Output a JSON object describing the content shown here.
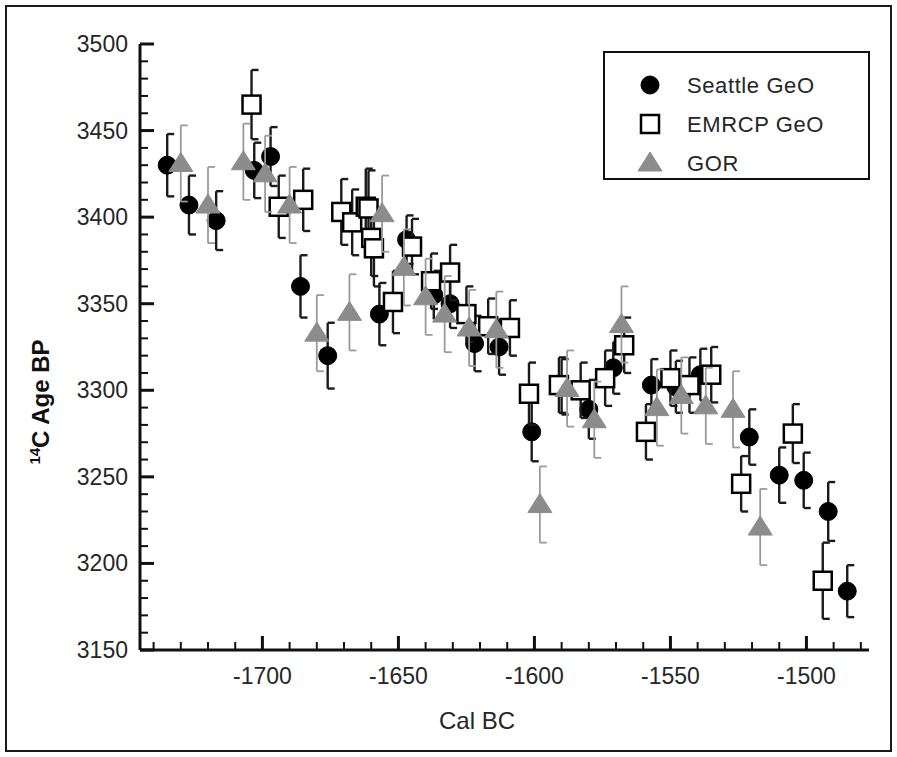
{
  "figure": {
    "xlabel": "Cal BC",
    "ylabel_sup": "14",
    "ylabel_main": "C Age BP"
  },
  "legend": {
    "entries": [
      {
        "label": "Seattle GeO",
        "marker": "filled-circle",
        "color": "#000000"
      },
      {
        "label": "EMRCP GeO",
        "marker": "open-square",
        "color": "#000000"
      },
      {
        "label": "GOR",
        "marker": "filled-triangle",
        "color": "#8c8c8c"
      }
    ]
  },
  "axes": {
    "x_ticks": [
      "-1700",
      "-1650",
      "-1600",
      "-1550",
      "-1500"
    ],
    "y_ticks": [
      "3150",
      "3200",
      "3250",
      "3300",
      "3350",
      "3400",
      "3450",
      "3500"
    ],
    "x_min": -1745,
    "x_max": -1477,
    "y_min": 3150,
    "y_max": 3500,
    "x_major_step": 50,
    "x_minor_step": 10,
    "y_major_step": 50,
    "y_minor_step": 10
  },
  "chart_data": {
    "type": "scatter",
    "title": "",
    "xlabel": "Cal BC",
    "ylabel": "14C Age BP",
    "xlim": [
      -1745,
      -1477
    ],
    "ylim": [
      3150,
      3500
    ],
    "grid": false,
    "legend_position": "top-right",
    "error_bars": "vertical 1-sigma",
    "series": [
      {
        "name": "Seattle GeO",
        "marker": "filled-circle",
        "color": "#000000",
        "points": [
          {
            "x": -1735,
            "y": 3430,
            "err": 18
          },
          {
            "x": -1727,
            "y": 3407,
            "err": 17
          },
          {
            "x": -1717,
            "y": 3398,
            "err": 17
          },
          {
            "x": -1703,
            "y": 3427,
            "err": 16
          },
          {
            "x": -1697,
            "y": 3435,
            "err": 17
          },
          {
            "x": -1686,
            "y": 3360,
            "err": 18
          },
          {
            "x": -1676,
            "y": 3320,
            "err": 19
          },
          {
            "x": -1657,
            "y": 3344,
            "err": 18
          },
          {
            "x": -1647,
            "y": 3387,
            "err": 14
          },
          {
            "x": -1637,
            "y": 3355,
            "err": 14
          },
          {
            "x": -1631,
            "y": 3350,
            "err": 14
          },
          {
            "x": -1622,
            "y": 3327,
            "err": 16
          },
          {
            "x": -1613,
            "y": 3325,
            "err": 16
          },
          {
            "x": -1601,
            "y": 3276,
            "err": 17
          },
          {
            "x": -1590,
            "y": 3302,
            "err": 16
          },
          {
            "x": -1580,
            "y": 3289,
            "err": 17
          },
          {
            "x": -1571,
            "y": 3313,
            "err": 15
          },
          {
            "x": -1557,
            "y": 3303,
            "err": 15
          },
          {
            "x": -1548,
            "y": 3302,
            "err": 15
          },
          {
            "x": -1539,
            "y": 3309,
            "err": 15
          },
          {
            "x": -1521,
            "y": 3273,
            "err": 16
          },
          {
            "x": -1510,
            "y": 3251,
            "err": 16
          },
          {
            "x": -1501,
            "y": 3248,
            "err": 16
          },
          {
            "x": -1492,
            "y": 3230,
            "err": 17
          },
          {
            "x": -1485,
            "y": 3184,
            "err": 15
          }
        ]
      },
      {
        "name": "EMRCP GeO",
        "marker": "open-square",
        "color": "#000000",
        "points": [
          {
            "x": -1704,
            "y": 3465,
            "err": 20
          },
          {
            "x": -1694,
            "y": 3406,
            "err": 18
          },
          {
            "x": -1685,
            "y": 3410,
            "err": 18
          },
          {
            "x": -1671,
            "y": 3403,
            "err": 19
          },
          {
            "x": -1667,
            "y": 3397,
            "err": 19
          },
          {
            "x": -1662,
            "y": 3406,
            "err": 22
          },
          {
            "x": -1661,
            "y": 3405,
            "err": 22
          },
          {
            "x": -1660,
            "y": 3388,
            "err": 22
          },
          {
            "x": -1659,
            "y": 3382,
            "err": 22
          },
          {
            "x": -1652,
            "y": 3351,
            "err": 18
          },
          {
            "x": -1645,
            "y": 3383,
            "err": 16
          },
          {
            "x": -1638,
            "y": 3363,
            "err": 16
          },
          {
            "x": -1631,
            "y": 3368,
            "err": 16
          },
          {
            "x": -1625,
            "y": 3344,
            "err": 16
          },
          {
            "x": -1617,
            "y": 3337,
            "err": 16
          },
          {
            "x": -1609,
            "y": 3336,
            "err": 16
          },
          {
            "x": -1602,
            "y": 3298,
            "err": 18
          },
          {
            "x": -1591,
            "y": 3303,
            "err": 16
          },
          {
            "x": -1583,
            "y": 3300,
            "err": 16
          },
          {
            "x": -1574,
            "y": 3307,
            "err": 16
          },
          {
            "x": -1567,
            "y": 3326,
            "err": 16
          },
          {
            "x": -1559,
            "y": 3276,
            "err": 16
          },
          {
            "x": -1550,
            "y": 3307,
            "err": 16
          },
          {
            "x": -1543,
            "y": 3303,
            "err": 16
          },
          {
            "x": -1535,
            "y": 3309,
            "err": 16
          },
          {
            "x": -1524,
            "y": 3246,
            "err": 16
          },
          {
            "x": -1505,
            "y": 3275,
            "err": 17
          },
          {
            "x": -1494,
            "y": 3190,
            "err": 22
          }
        ]
      },
      {
        "name": "GOR",
        "marker": "filled-triangle",
        "color": "#8c8c8c",
        "points": [
          {
            "x": -1730,
            "y": 3431,
            "err": 22
          },
          {
            "x": -1720,
            "y": 3407,
            "err": 22
          },
          {
            "x": -1707,
            "y": 3432,
            "err": 22
          },
          {
            "x": -1699,
            "y": 3425,
            "err": 22
          },
          {
            "x": -1690,
            "y": 3407,
            "err": 22
          },
          {
            "x": -1680,
            "y": 3333,
            "err": 22
          },
          {
            "x": -1668,
            "y": 3345,
            "err": 22
          },
          {
            "x": -1656,
            "y": 3402,
            "err": 22
          },
          {
            "x": -1648,
            "y": 3371,
            "err": 22
          },
          {
            "x": -1640,
            "y": 3354,
            "err": 22
          },
          {
            "x": -1633,
            "y": 3344,
            "err": 22
          },
          {
            "x": -1624,
            "y": 3336,
            "err": 22
          },
          {
            "x": -1614,
            "y": 3335,
            "err": 22
          },
          {
            "x": -1598,
            "y": 3234,
            "err": 22
          },
          {
            "x": -1588,
            "y": 3301,
            "err": 22
          },
          {
            "x": -1578,
            "y": 3283,
            "err": 22
          },
          {
            "x": -1568,
            "y": 3338,
            "err": 22
          },
          {
            "x": -1555,
            "y": 3290,
            "err": 22
          },
          {
            "x": -1546,
            "y": 3297,
            "err": 22
          },
          {
            "x": -1537,
            "y": 3291,
            "err": 22
          },
          {
            "x": -1527,
            "y": 3289,
            "err": 22
          },
          {
            "x": -1517,
            "y": 3221,
            "err": 22
          }
        ]
      }
    ]
  }
}
